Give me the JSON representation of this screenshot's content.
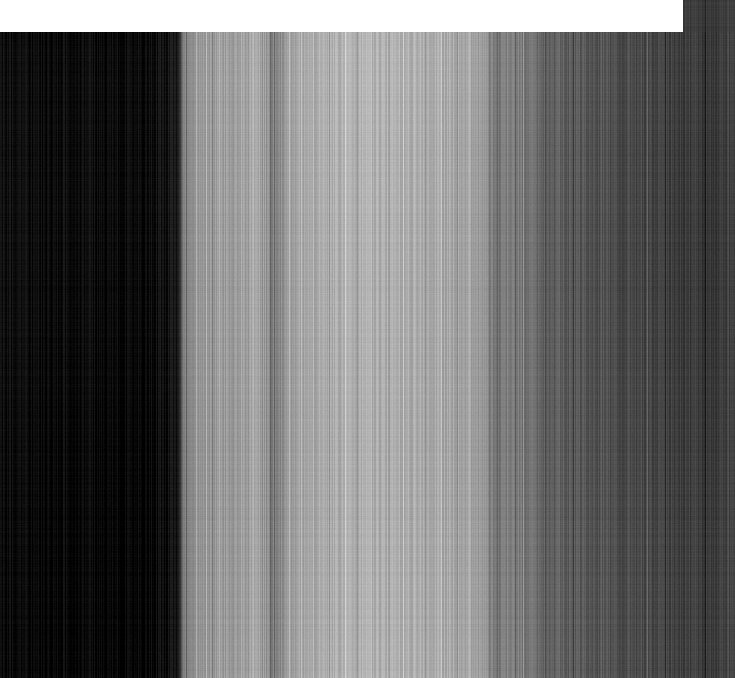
{
  "image": {
    "kind": "extreme-zoom-crop",
    "subject_description": "Heavily magnified photographic crop showing fine vertical stripe texture",
    "width_px": 735,
    "height_px": 678,
    "background_color": "#ffffff",
    "regions": {
      "white_plate": {
        "name": "white-plate",
        "x": 0,
        "y": 0,
        "width": 683,
        "height": 32,
        "color": "#ffffff"
      },
      "striped_field": {
        "name": "striped-field",
        "x": 0,
        "y": 32,
        "width": 735,
        "height": 646
      },
      "right_column": {
        "name": "right-dark-column",
        "x": 683,
        "y": 0,
        "width": 52,
        "height": 678,
        "color": "#3c3c3c"
      }
    },
    "texture": {
      "orientation": "vertical",
      "stripe_width_px": 1,
      "noise_amplitude": 14,
      "row_noise_amplitude": 3
    },
    "palette": {
      "darkest": "#070707",
      "left_dark": "#0d0d0d",
      "mid_gray": "#8e8e8e",
      "bright_plateau": "#a9a9a9",
      "brightest": "#b4b4b4",
      "right_dark": "#3a3a3a",
      "far_right": "#3c3c3c"
    },
    "brightness_profile": {
      "description": "Luminance sampled along the horizontal axis of the striped field",
      "x": [
        0,
        20,
        45,
        70,
        95,
        120,
        145,
        165,
        178,
        183,
        188,
        196,
        204,
        212,
        220,
        232,
        246,
        258,
        266,
        272,
        278,
        286,
        296,
        308,
        320,
        336,
        352,
        368,
        384,
        400,
        416,
        432,
        448,
        462,
        476,
        486,
        492,
        498,
        506,
        512,
        520,
        530,
        540,
        552,
        566,
        580,
        596,
        612,
        628,
        644,
        660,
        672,
        683,
        700,
        716,
        728,
        735
      ],
      "luminance": [
        14,
        11,
        9,
        13,
        10,
        8,
        12,
        16,
        22,
        120,
        140,
        152,
        146,
        158,
        150,
        162,
        158,
        168,
        150,
        126,
        130,
        158,
        166,
        170,
        172,
        174,
        176,
        178,
        176,
        174,
        176,
        172,
        170,
        166,
        160,
        150,
        128,
        118,
        126,
        132,
        120,
        112,
        104,
        96,
        92,
        88,
        84,
        80,
        76,
        72,
        68,
        64,
        62,
        60,
        58,
        62,
        58
      ]
    }
  },
  "accessibility": {
    "alt_text": "Extreme close-up crop with vertical banding; dark at left, bright in the middle, darkening toward the right, with a white band across the top.",
    "caption": ""
  }
}
